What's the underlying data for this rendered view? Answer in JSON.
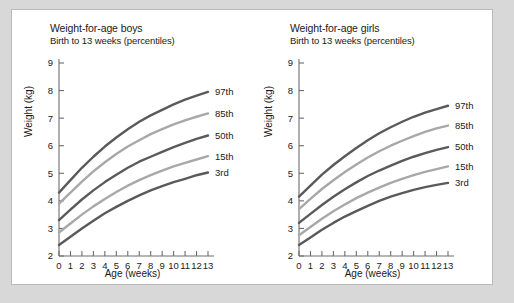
{
  "figure": {
    "background": "#ffffff",
    "border_color": "#b9b9b9",
    "outer_background": "#d8d8d8"
  },
  "chart_data": [
    {
      "type": "line",
      "title": "Weight-for-age boys",
      "subtitle": "Birth to 13 weeks (percentiles)",
      "xlabel": "Age (weeks)",
      "ylabel": "Weight (kg)",
      "xlim": [
        0,
        13
      ],
      "ylim": [
        2,
        9
      ],
      "xticks": [
        0,
        1,
        2,
        3,
        4,
        5,
        6,
        7,
        8,
        9,
        10,
        11,
        12,
        13
      ],
      "yticks": [
        2,
        3,
        4,
        5,
        6,
        7,
        8,
        9
      ],
      "xticklabels": [
        "0",
        "1",
        "2",
        "3",
        "4",
        "5",
        "6",
        "7",
        "8",
        "9",
        "10",
        "11",
        "12",
        "13"
      ],
      "yticklabels": [
        "2",
        "3",
        "4",
        "5",
        "6",
        "7",
        "8",
        "9"
      ],
      "grid": false,
      "legend": "right-of-curve-ends",
      "x": [
        0,
        1,
        2,
        3,
        4,
        5,
        6,
        7,
        8,
        9,
        10,
        11,
        12,
        13
      ],
      "series": [
        {
          "name": "97th",
          "label": "97th",
          "color": "#5a5a5a",
          "values": [
            4.3,
            4.75,
            5.2,
            5.6,
            5.97,
            6.3,
            6.6,
            6.87,
            7.1,
            7.3,
            7.5,
            7.67,
            7.82,
            7.95
          ]
        },
        {
          "name": "85th",
          "label": "85th",
          "color": "#a8a8a8",
          "values": [
            3.9,
            4.3,
            4.7,
            5.07,
            5.4,
            5.7,
            5.97,
            6.2,
            6.42,
            6.6,
            6.77,
            6.92,
            7.05,
            7.17
          ]
        },
        {
          "name": "50th",
          "label": "50th",
          "color": "#5a5a5a",
          "values": [
            3.3,
            3.68,
            4.05,
            4.38,
            4.68,
            4.95,
            5.2,
            5.42,
            5.6,
            5.78,
            5.95,
            6.1,
            6.25,
            6.37
          ]
        },
        {
          "name": "15th",
          "label": "15th",
          "color": "#a8a8a8",
          "values": [
            2.85,
            3.18,
            3.5,
            3.8,
            4.07,
            4.32,
            4.55,
            4.75,
            4.93,
            5.1,
            5.25,
            5.38,
            5.5,
            5.62
          ]
        },
        {
          "name": "3rd",
          "label": "3rd",
          "color": "#5a5a5a",
          "values": [
            2.4,
            2.7,
            3.0,
            3.28,
            3.55,
            3.78,
            4.0,
            4.2,
            4.38,
            4.53,
            4.68,
            4.8,
            4.93,
            5.03
          ]
        }
      ]
    },
    {
      "type": "line",
      "title": "Weight-for-age girls",
      "subtitle": "Birth to 13 weeks (percentiles)",
      "xlabel": "Age (weeks)",
      "ylabel": "Weight (kg)",
      "xlim": [
        0,
        13
      ],
      "ylim": [
        2,
        9
      ],
      "xticks": [
        0,
        1,
        2,
        3,
        4,
        5,
        6,
        7,
        8,
        9,
        10,
        11,
        12,
        13
      ],
      "yticks": [
        2,
        3,
        4,
        5,
        6,
        7,
        8,
        9
      ],
      "xticklabels": [
        "0",
        "1",
        "2",
        "3",
        "4",
        "5",
        "6",
        "7",
        "8",
        "9",
        "10",
        "11",
        "12",
        "13"
      ],
      "yticklabels": [
        "2",
        "3",
        "4",
        "5",
        "6",
        "7",
        "8",
        "9"
      ],
      "grid": false,
      "legend": "right-of-curve-ends",
      "x": [
        0,
        1,
        2,
        3,
        4,
        5,
        6,
        7,
        8,
        9,
        10,
        11,
        12,
        13
      ],
      "series": [
        {
          "name": "97th",
          "label": "97th",
          "color": "#5a5a5a",
          "values": [
            4.15,
            4.55,
            4.95,
            5.3,
            5.62,
            5.92,
            6.2,
            6.45,
            6.67,
            6.87,
            7.05,
            7.2,
            7.33,
            7.45
          ]
        },
        {
          "name": "85th",
          "label": "85th",
          "color": "#a8a8a8",
          "values": [
            3.7,
            4.07,
            4.43,
            4.75,
            5.05,
            5.32,
            5.57,
            5.8,
            6.0,
            6.18,
            6.35,
            6.5,
            6.63,
            6.73
          ]
        },
        {
          "name": "50th",
          "label": "50th",
          "color": "#5a5a5a",
          "values": [
            3.2,
            3.53,
            3.85,
            4.15,
            4.42,
            4.67,
            4.9,
            5.1,
            5.28,
            5.45,
            5.6,
            5.73,
            5.85,
            5.95
          ]
        },
        {
          "name": "15th",
          "label": "15th",
          "color": "#a8a8a8",
          "values": [
            2.75,
            3.05,
            3.35,
            3.62,
            3.87,
            4.1,
            4.3,
            4.48,
            4.65,
            4.8,
            4.93,
            5.05,
            5.15,
            5.25
          ]
        },
        {
          "name": "3rd",
          "label": "3rd",
          "color": "#5a5a5a",
          "values": [
            2.4,
            2.67,
            2.95,
            3.2,
            3.43,
            3.63,
            3.82,
            4.0,
            4.15,
            4.28,
            4.4,
            4.5,
            4.58,
            4.65
          ]
        }
      ]
    }
  ]
}
